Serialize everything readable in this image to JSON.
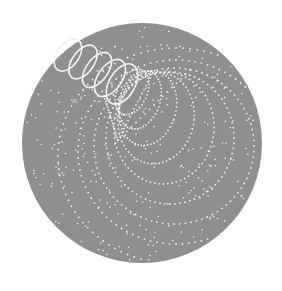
{
  "canvas": {
    "width": 282,
    "height": 291,
    "background": "#ffffff"
  },
  "disk": {
    "cx": 142,
    "cy": 143,
    "r": 120,
    "fill": "#8f8f8f"
  },
  "dot_color": "#f2f2f2",
  "helix": {
    "solid_loops": [
      {
        "cx": 68,
        "cy": 55,
        "rx": 11,
        "ry": 18,
        "rot": 35
      },
      {
        "cx": 83,
        "cy": 62,
        "rx": 11,
        "ry": 19,
        "rot": 35
      },
      {
        "cx": 97,
        "cy": 70,
        "rx": 11,
        "ry": 20,
        "rot": 35
      },
      {
        "cx": 110,
        "cy": 78,
        "rx": 12,
        "ry": 21,
        "rot": 35
      },
      {
        "cx": 122,
        "cy": 84,
        "rx": 13,
        "ry": 22,
        "rot": 30
      }
    ],
    "stroke_width": 1.6
  },
  "dotted_ellipses": [
    {
      "cx": 132,
      "cy": 92,
      "rx": 15,
      "ry": 24,
      "rot": 25,
      "dots": 40
    },
    {
      "cx": 140,
      "cy": 100,
      "rx": 20,
      "ry": 30,
      "rot": 20,
      "dots": 48
    },
    {
      "cx": 148,
      "cy": 108,
      "rx": 28,
      "ry": 38,
      "rot": 15,
      "dots": 56
    },
    {
      "cx": 156,
      "cy": 118,
      "rx": 38,
      "ry": 46,
      "rot": 10,
      "dots": 64
    },
    {
      "cx": 164,
      "cy": 128,
      "rx": 50,
      "ry": 56,
      "rot": 5,
      "dots": 72
    },
    {
      "cx": 170,
      "cy": 138,
      "rx": 64,
      "ry": 66,
      "rot": 0,
      "dots": 80
    },
    {
      "cx": 174,
      "cy": 146,
      "rx": 80,
      "ry": 78,
      "rot": 0,
      "dots": 88
    },
    {
      "cx": 176,
      "cy": 152,
      "rx": 98,
      "ry": 92,
      "rot": 0,
      "dots": 96
    },
    {
      "cx": 176,
      "cy": 156,
      "rx": 118,
      "ry": 108,
      "rot": 0,
      "dots": 104
    }
  ],
  "converging_lines": {
    "apex": {
      "x": 118,
      "y": 140
    },
    "ends": [
      {
        "x": 104,
        "y": 96
      },
      {
        "x": 150,
        "y": 78
      },
      {
        "x": 190,
        "y": 70
      }
    ],
    "dots_per_line": 16
  },
  "scatter": {
    "seed": 7,
    "count": 260
  }
}
